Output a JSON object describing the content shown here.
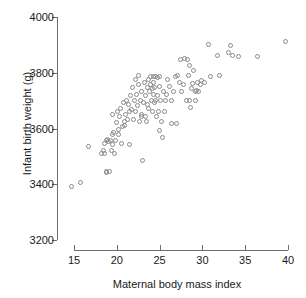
{
  "chart_data": {
    "type": "scatter",
    "title": "",
    "xlabel": "Maternal body mass index",
    "ylabel": "Infant birth weight (g)",
    "xlim": [
      14.0,
      41.0
    ],
    "ylim": [
      3200,
      4000
    ],
    "xticks": [
      15,
      20,
      25,
      30,
      35,
      40
    ],
    "yticks": [
      3200,
      3400,
      3600,
      3800,
      4000
    ],
    "xtick_labels": [
      "15",
      "20",
      "25",
      "30",
      "35",
      "40"
    ],
    "ytick_labels": [
      "3200",
      "3400",
      "3600",
      "3800",
      "4000"
    ],
    "grid": false,
    "legend": "none",
    "marker": "open-circle",
    "marker_color": "#8a8a8a",
    "n_points": 130,
    "x": [
      14.8,
      15.8,
      16.8,
      18.3,
      18.5,
      18.6,
      18.6,
      18.8,
      18.9,
      18.9,
      19.0,
      19.1,
      19.2,
      19.3,
      19.4,
      19.5,
      19.5,
      19.6,
      19.7,
      19.8,
      19.9,
      20.0,
      20.1,
      20.2,
      20.3,
      20.4,
      20.5,
      20.6,
      20.7,
      20.8,
      20.9,
      21.0,
      21.1,
      21.2,
      21.3,
      21.4,
      21.5,
      21.6,
      21.7,
      21.8,
      21.9,
      22.0,
      22.1,
      22.2,
      22.3,
      22.4,
      22.5,
      22.6,
      22.6,
      22.7,
      22.8,
      22.9,
      23.0,
      23.0,
      23.1,
      23.2,
      23.3,
      23.4,
      23.4,
      23.5,
      23.6,
      23.7,
      23.8,
      23.8,
      23.9,
      24.0,
      24.0,
      24.1,
      24.2,
      24.2,
      24.3,
      24.3,
      24.4,
      24.5,
      24.5,
      24.6,
      24.6,
      24.7,
      24.8,
      24.8,
      24.9,
      25.0,
      25.0,
      25.1,
      25.2,
      25.3,
      25.4,
      25.5,
      25.6,
      25.8,
      25.9,
      26.0,
      26.2,
      26.4,
      26.5,
      26.7,
      26.9,
      27.0,
      27.2,
      27.4,
      27.5,
      27.6,
      27.8,
      28.0,
      28.2,
      28.3,
      28.4,
      28.5,
      28.6,
      28.7,
      28.8,
      28.9,
      29.0,
      29.2,
      29.3,
      29.4,
      29.5,
      29.6,
      29.8,
      30.0,
      30.3,
      30.8,
      31.0,
      31.8,
      32.0,
      33.1,
      33.3,
      33.6,
      34.3,
      36.5,
      39.8
    ],
    "y": [
      3390,
      3405,
      3535,
      3510,
      3520,
      3545,
      3510,
      3440,
      3445,
      3555,
      3560,
      3550,
      3445,
      3555,
      3520,
      3650,
      3575,
      3540,
      3585,
      3510,
      3555,
      3620,
      3660,
      3575,
      3595,
      3640,
      3670,
      3545,
      3605,
      3690,
      3625,
      3610,
      3650,
      3700,
      3630,
      3685,
      3660,
      3540,
      3715,
      3665,
      3745,
      3630,
      3700,
      3775,
      3660,
      3720,
      3680,
      3790,
      3755,
      3625,
      3700,
      3640,
      3650,
      3730,
      3485,
      3690,
      3765,
      3715,
      3640,
      3625,
      3685,
      3745,
      3670,
      3775,
      3730,
      3785,
      3755,
      3700,
      3740,
      3660,
      3785,
      3720,
      3765,
      3745,
      3690,
      3785,
      3700,
      3640,
      3780,
      3715,
      3660,
      3785,
      3590,
      3750,
      3700,
      3625,
      3565,
      3730,
      3660,
      3700,
      3720,
      3775,
      3750,
      3615,
      3700,
      3730,
      3785,
      3615,
      3790,
      3765,
      3845,
      3730,
      3755,
      3850,
      3700,
      3845,
      3790,
      3700,
      3825,
      3675,
      3740,
      3760,
      3805,
      3730,
      3700,
      3735,
      3765,
      3730,
      3755,
      3770,
      3765,
      3900,
      3785,
      3860,
      3790,
      3870,
      3895,
      3860,
      3855,
      3855,
      3910
    ]
  },
  "axes": {
    "y_title": "Infant birth weight (g)",
    "x_title": "Maternal body mass index",
    "y_labels": [
      "4000",
      "3800",
      "3600",
      "3400",
      "3200"
    ],
    "x_labels": [
      "15",
      "20",
      "25",
      "30",
      "35",
      "40"
    ]
  }
}
